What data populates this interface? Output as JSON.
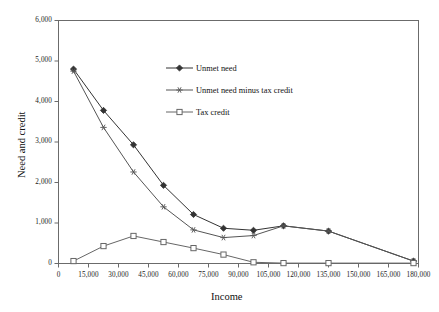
{
  "chart_data": {
    "type": "line",
    "title": "",
    "xlabel": "Income",
    "ylabel": "Need and credit",
    "xlim": [
      0,
      180000
    ],
    "ylim": [
      0,
      6000
    ],
    "grid": false,
    "legend_position": "inside-top-center",
    "x_ticks": [
      "0",
      "15,000",
      "30,000",
      "45,000",
      "60,000",
      "75,000",
      "90,000",
      "105,000",
      "120,000",
      "135,000",
      "150,000",
      "165,000",
      "180,000"
    ],
    "x_tick_values": [
      0,
      15000,
      30000,
      45000,
      60000,
      75000,
      90000,
      105000,
      120000,
      135000,
      150000,
      165000,
      180000
    ],
    "y_ticks": [
      "0",
      "1,000",
      "2,000",
      "3,000",
      "4,000",
      "5,000",
      "6,000"
    ],
    "y_tick_values": [
      0,
      1000,
      2000,
      3000,
      4000,
      5000,
      6000
    ],
    "x": [
      7500,
      22500,
      37500,
      52500,
      67500,
      82500,
      97500,
      112500,
      135000,
      177500
    ],
    "series": [
      {
        "name": "Unmet need",
        "marker": "diamond",
        "color": "#333333",
        "values": [
          4800,
          3780,
          2930,
          1930,
          1210,
          870,
          820,
          930,
          800,
          60
        ]
      },
      {
        "name": "Unmet need minus tax credit",
        "marker": "asterisk",
        "color": "#555555",
        "values": [
          4750,
          3360,
          2260,
          1400,
          830,
          640,
          690,
          930,
          800,
          60
        ]
      },
      {
        "name": "Tax credit",
        "marker": "square",
        "color": "#666666",
        "values": [
          60,
          430,
          680,
          530,
          380,
          220,
          30,
          10,
          10,
          10
        ]
      }
    ]
  },
  "legend": {
    "items": [
      {
        "label": "Unmet need"
      },
      {
        "label": "Unmet need minus tax credit"
      },
      {
        "label": "Tax credit"
      }
    ]
  },
  "axes": {
    "x_title": "Income",
    "y_title": "Need and credit"
  }
}
